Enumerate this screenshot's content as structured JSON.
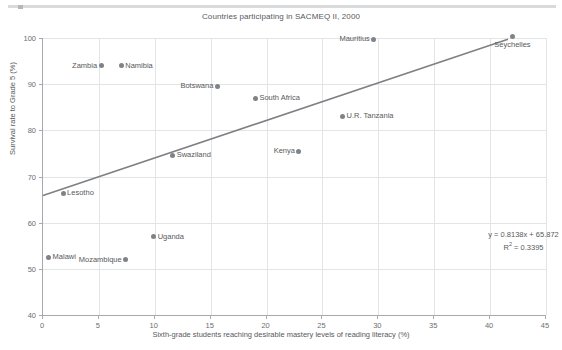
{
  "decor": {
    "top_rule": "horizontal-rule"
  },
  "chart_data": {
    "type": "scatter",
    "title": "Countries participating in SACMEQ II, 2000",
    "xlabel": "Sixth-grade students reaching desirable mastery levels of reading literacy (%)",
    "ylabel": "Survival rate to Grade 5 (%)",
    "xlim": [
      0,
      45
    ],
    "ylim": [
      40,
      100
    ],
    "xticks": [
      0,
      5,
      10,
      15,
      20,
      25,
      30,
      35,
      40,
      45
    ],
    "yticks": [
      40,
      50,
      60,
      70,
      80,
      90,
      100
    ],
    "grid": true,
    "legend": "none",
    "point_color": "#808285",
    "trendline_color": "#7f8084",
    "points": [
      {
        "name": "Malawi",
        "x": 0.5,
        "y": 52.5,
        "label_pos": "right"
      },
      {
        "name": "Lesotho",
        "x": 1.8,
        "y": 66.4,
        "label_pos": "right"
      },
      {
        "name": "Zambia",
        "x": 5.2,
        "y": 94.0,
        "label_pos": "left"
      },
      {
        "name": "Namibia",
        "x": 7.0,
        "y": 94.0,
        "label_pos": "right"
      },
      {
        "name": "Mozambique",
        "x": 7.4,
        "y": 52.0,
        "label_pos": "left"
      },
      {
        "name": "Uganda",
        "x": 9.9,
        "y": 57.0,
        "label_pos": "right"
      },
      {
        "name": "Swaziland",
        "x": 11.6,
        "y": 74.6,
        "label_pos": "right"
      },
      {
        "name": "Botswana",
        "x": 15.6,
        "y": 89.6,
        "label_pos": "left"
      },
      {
        "name": "South Africa",
        "x": 19.0,
        "y": 87.0,
        "label_pos": "right"
      },
      {
        "name": "Kenya",
        "x": 22.9,
        "y": 75.5,
        "label_pos": "left"
      },
      {
        "name": "U.R. Tanzania",
        "x": 26.8,
        "y": 83.0,
        "label_pos": "right"
      },
      {
        "name": "Mauritius",
        "x": 29.6,
        "y": 99.7,
        "label_pos": "left"
      },
      {
        "name": "Seychelles",
        "x": 42.0,
        "y": 100.4,
        "label_pos": "below"
      }
    ],
    "trendline": {
      "slope": 0.8138,
      "intercept": 65.872,
      "r_squared": 0.3395,
      "x_start": 0,
      "x_end": 41.6,
      "equation_text": "y = 0.8138x + 65.872",
      "r2_prefix": "R",
      "r2_exponent": "2",
      "r2_text": " = 0.3395"
    }
  }
}
